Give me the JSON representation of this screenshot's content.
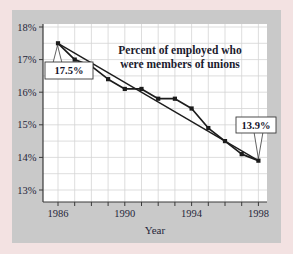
{
  "figure": {
    "outer_background_color": "#f3e2e2",
    "panel_color": "#c9c9c9",
    "plot_background_color": "#ffffff",
    "gridline_color": "#d4d4d4",
    "axis_color": "#3a3a3a",
    "line_color": "#1c1c1c",
    "text_color": "#1b1b2e"
  },
  "chart_data": {
    "type": "line",
    "title": "Percent of employed who were members of unions",
    "title_lines": [
      "Percent of employed who",
      "were members of unions"
    ],
    "xlabel": "Year",
    "ylabel": "",
    "xlim": [
      1986,
      1998
    ],
    "ylim": [
      13,
      18
    ],
    "grid": "horizontal every 0.5, vertical every year",
    "legend_position": "none",
    "x": [
      1986,
      1987,
      1988,
      1989,
      1990,
      1991,
      1992,
      1993,
      1994,
      1995,
      1996,
      1997,
      1998
    ],
    "series": [
      {
        "name": "union-membership-rate",
        "marker": "square",
        "values": [
          17.5,
          17.0,
          16.8,
          16.4,
          16.1,
          16.1,
          15.8,
          15.8,
          15.5,
          14.9,
          14.5,
          14.1,
          13.9
        ]
      },
      {
        "name": "straight-trend-line",
        "marker": "none",
        "x": [
          1986,
          1998
        ],
        "values": [
          17.5,
          13.9
        ]
      }
    ],
    "y_tick_labels": [
      "18%",
      "17%",
      "16%",
      "15%",
      "14%",
      "13%"
    ],
    "y_tick_values": [
      18,
      17,
      16,
      15,
      14,
      13
    ],
    "x_tick_labeled_values": [
      1986,
      1990,
      1994,
      1998
    ],
    "x_tick_labels": [
      "1986",
      "1990",
      "1994",
      "1998"
    ],
    "annotations": [
      {
        "label": "17.5%",
        "x": 1986,
        "y": 17.5,
        "side": "below"
      },
      {
        "label": "13.9%",
        "x": 1998,
        "y": 13.9,
        "side": "above"
      }
    ]
  }
}
